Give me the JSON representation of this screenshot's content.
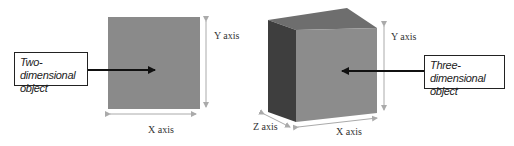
{
  "left_figure": {
    "label_line1": "Two-dimensional",
    "label_line2": "object",
    "y_axis_label": "Y axis",
    "x_axis_label": "X axis",
    "square_color": "#8a8a8a"
  },
  "right_figure": {
    "label_line1": "Three-dimensional",
    "label_line2": "object",
    "y_axis_label": "Y axis",
    "x_axis_label": "X axis",
    "z_axis_label": "Z axis",
    "front_face_color": "#8c8c8c",
    "top_face_color": "#6e6e6e",
    "side_face_color": "#3e3e3e"
  }
}
